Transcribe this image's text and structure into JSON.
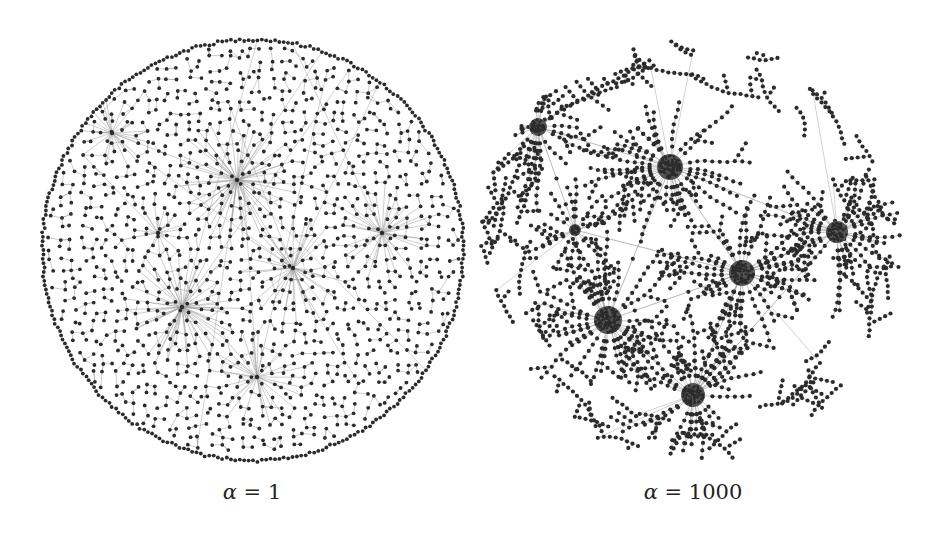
{
  "figure": {
    "background": "#ffffff",
    "node_color": "#2b2b2b",
    "edge_color": "#9a9a9a",
    "panels": [
      {
        "id": "left",
        "label_symbol": "α",
        "label_eq": " = ",
        "label_value": "1",
        "label_x": 252,
        "center": [
          253,
          250
        ],
        "radius": 212,
        "style": "dense",
        "hubs": [
          {
            "x": 112,
            "y": 133,
            "size": 1.2
          },
          {
            "x": 237,
            "y": 180,
            "size": 2.0
          },
          {
            "x": 158,
            "y": 233,
            "size": 1.0
          },
          {
            "x": 382,
            "y": 233,
            "size": 1.6
          },
          {
            "x": 293,
            "y": 268,
            "size": 1.8
          },
          {
            "x": 182,
            "y": 307,
            "size": 2.0
          },
          {
            "x": 257,
            "y": 377,
            "size": 1.6
          }
        ]
      },
      {
        "id": "right",
        "label_symbol": "α",
        "label_eq": " = ",
        "label_value": "1000",
        "label_x": 693,
        "center": [
          690,
          250
        ],
        "radius": 214,
        "style": "clustered",
        "hubs": [
          {
            "x": 538,
            "y": 127,
            "size": 9
          },
          {
            "x": 670,
            "y": 167,
            "size": 13
          },
          {
            "x": 575,
            "y": 230,
            "size": 6
          },
          {
            "x": 837,
            "y": 232,
            "size": 11
          },
          {
            "x": 742,
            "y": 273,
            "size": 13
          },
          {
            "x": 608,
            "y": 320,
            "size": 14
          },
          {
            "x": 693,
            "y": 395,
            "size": 12
          }
        ],
        "hub_links": [
          [
            0,
            1
          ],
          [
            0,
            2
          ],
          [
            1,
            5
          ],
          [
            1,
            4
          ],
          [
            2,
            4
          ],
          [
            4,
            3
          ],
          [
            4,
            5
          ],
          [
            4,
            6
          ],
          [
            5,
            6
          ],
          [
            3,
            6
          ],
          [
            1,
            3
          ]
        ]
      }
    ]
  }
}
